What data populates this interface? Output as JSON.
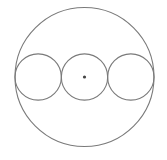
{
  "diagram": {
    "title": "",
    "outer_circle": {
      "label": "",
      "radius_units": 3
    },
    "inner_circles": [
      {
        "label": "",
        "radius_units": 1,
        "position": "left"
      },
      {
        "label": "",
        "radius_units": 1,
        "position": "center"
      },
      {
        "label": "",
        "radius_units": 1,
        "position": "right"
      }
    ],
    "center_point": {
      "label": "",
      "marked": true
    },
    "colors": {
      "stroke": "#7a7a7a",
      "dot": "#444444",
      "background": "#ffffff"
    }
  }
}
